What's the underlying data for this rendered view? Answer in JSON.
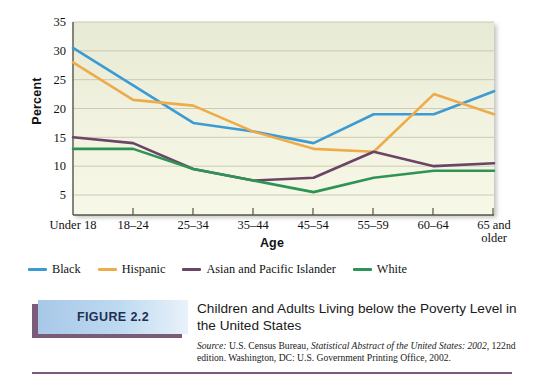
{
  "chart_data": {
    "type": "line",
    "title": "Children and Adults Living below the Poverty Level in the United States",
    "xlabel": "Age",
    "ylabel": "Percent",
    "categories": [
      "Under 18",
      "18–24",
      "25–34",
      "35–44",
      "45–54",
      "55–59",
      "60–64",
      "65 and older"
    ],
    "yticks": [
      5,
      10,
      15,
      20,
      25,
      30,
      35
    ],
    "ylim": [
      2.5,
      35
    ],
    "grid": true,
    "legend_position": "below-axis-left",
    "series": [
      {
        "name": "Black",
        "color": "#3d9bd4",
        "values": [
          30.5,
          24.0,
          17.5,
          16.0,
          14.0,
          19.0,
          19.0,
          23.0
        ]
      },
      {
        "name": "Hispanic",
        "color": "#eeab4a",
        "values": [
          28.0,
          21.5,
          20.5,
          16.0,
          13.0,
          12.5,
          22.5,
          19.0
        ]
      },
      {
        "name": "Asian and Pacific Islander",
        "color": "#6b4566",
        "values": [
          15.0,
          14.0,
          9.5,
          7.5,
          8.0,
          12.5,
          10.0,
          10.5
        ]
      },
      {
        "name": "White",
        "color": "#2f9356",
        "values": [
          13.0,
          13.0,
          9.5,
          7.5,
          5.5,
          8.0,
          9.2,
          9.2
        ]
      }
    ]
  },
  "axis": {
    "ylabel": "Percent",
    "xlabel": "Age",
    "yticks": [
      "35",
      "30",
      "25",
      "20",
      "15",
      "10",
      "5"
    ],
    "xticks": [
      {
        "line1": "Under 18",
        "line2": ""
      },
      {
        "line1": "18–24",
        "line2": ""
      },
      {
        "line1": "25–34",
        "line2": ""
      },
      {
        "line1": "35–44",
        "line2": ""
      },
      {
        "line1": "45–54",
        "line2": ""
      },
      {
        "line1": "55–59",
        "line2": ""
      },
      {
        "line1": "60–64",
        "line2": ""
      },
      {
        "line1": "65 and",
        "line2": "older"
      }
    ]
  },
  "legend": {
    "items": [
      {
        "label": "Black",
        "color": "#3d9bd4"
      },
      {
        "label": "Hispanic",
        "color": "#eeab4a"
      },
      {
        "label": "Asian and Pacific Islander",
        "color": "#6b4566"
      },
      {
        "label": "White",
        "color": "#2f9356"
      }
    ]
  },
  "caption": {
    "tag": "FIGURE 2.2",
    "title": "Children and Adults Living below the Poverty Level in the United States",
    "source_label": "Source:",
    "source_part1": "U.S. Census Bureau,",
    "source_italic": "Statistical Abstract of the United States: 2002,",
    "source_part2": "122nd edition. Washington, DC: U.S. Government Printing Office, 2002."
  },
  "colors": {
    "plot_bg_top": "#e9ebd7",
    "plot_bg_bottom": "#f7f7e6",
    "grid": "#c9c9b2",
    "axis": "#5e5e4e",
    "rule": "#7a5c79",
    "tag_text": "#1f2f52"
  }
}
